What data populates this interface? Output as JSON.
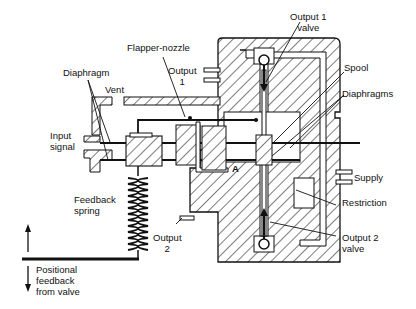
{
  "diagram": {
    "type": "mechanical-cross-section",
    "colors": {
      "ink": "#111111",
      "background": "#ffffff"
    },
    "labels": {
      "output1_valve": {
        "line1": "Output 1",
        "line2": "valve"
      },
      "flapper_nozzle": "Flapper-nozzle",
      "spool": "Spool",
      "diaphragm": "Diaphragm",
      "output1": {
        "line1": "Output",
        "line2": "1"
      },
      "diaphragms": "Diaphragms",
      "vent": "Vent",
      "input_signal": {
        "line1": "Input",
        "line2": "signal"
      },
      "point_a": "A",
      "supply": "Supply",
      "restriction": "Restriction",
      "feedback_spring": {
        "line1": "Feedback",
        "line2": "spring"
      },
      "output2": {
        "line1": "Output",
        "line2": "2"
      },
      "output2_valve": {
        "line1": "Output 2",
        "line2": "valve"
      },
      "positional_feedback": {
        "line1": "Positional",
        "line2": "feedback",
        "line3": "from valve"
      }
    }
  }
}
